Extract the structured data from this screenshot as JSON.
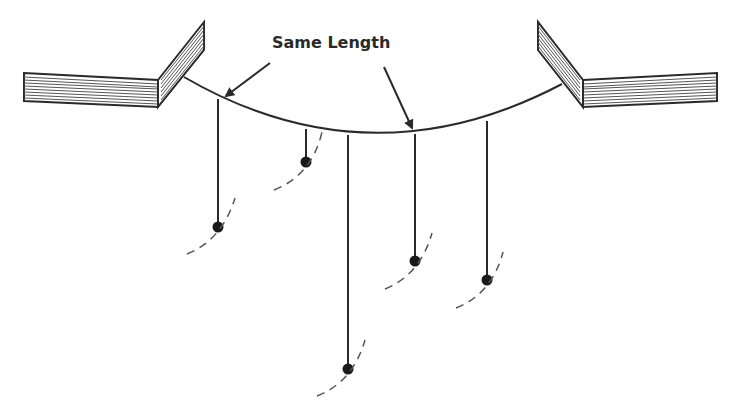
{
  "diagram": {
    "annotation": {
      "text": "Same Length",
      "points_to": [
        "pendulum-1",
        "pendulum-4"
      ]
    },
    "pendulums": [
      {
        "id": "pendulum-1",
        "relative_length": "medium",
        "same_length_group": "A"
      },
      {
        "id": "pendulum-2",
        "relative_length": "short"
      },
      {
        "id": "pendulum-3",
        "relative_length": "long"
      },
      {
        "id": "pendulum-4",
        "relative_length": "medium",
        "same_length_group": "A"
      },
      {
        "id": "pendulum-5",
        "relative_length": "medium-long"
      }
    ],
    "supports": [
      "left-support",
      "right-support"
    ],
    "colors": {
      "line": "#2a2a2a",
      "dash": "#555555",
      "background": "#ffffff"
    }
  }
}
